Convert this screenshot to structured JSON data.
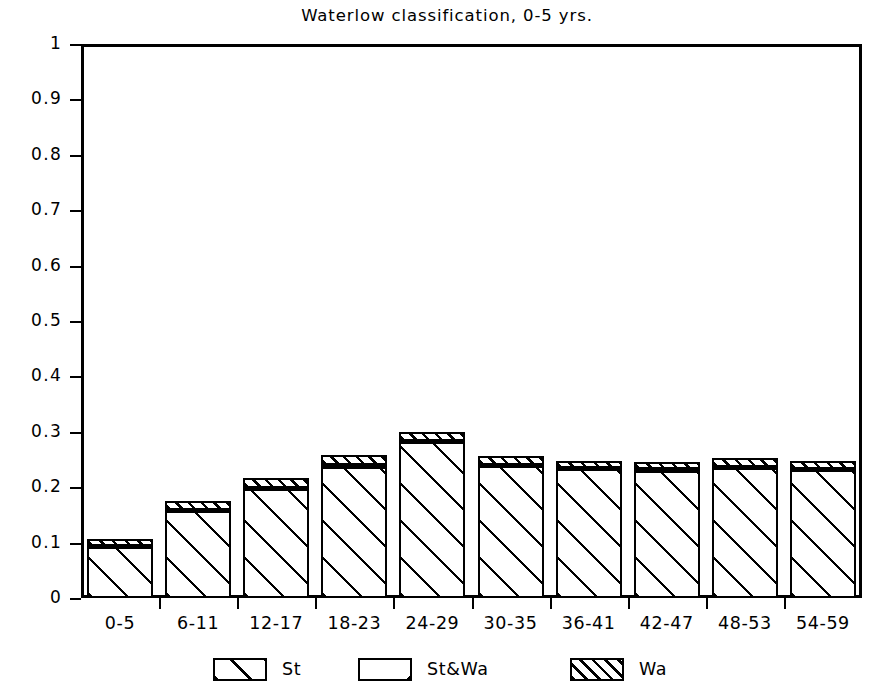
{
  "chart_data": {
    "type": "bar",
    "title": "Waterlow classification, 0-5 yrs.",
    "xlabel": "",
    "ylabel": "",
    "ylim": [
      0,
      1
    ],
    "yticks": [
      "0",
      "0.1",
      "0.2",
      "0.3",
      "0.4",
      "0.5",
      "0.6",
      "0.7",
      "0.8",
      "0.9",
      "1"
    ],
    "ytick_values": [
      0,
      0.1,
      0.2,
      0.3,
      0.4,
      0.5,
      0.6,
      0.7,
      0.8,
      0.9,
      1
    ],
    "grid": false,
    "stacked": true,
    "legend_position": "bottom",
    "categories": [
      "0-5",
      "6-11",
      "12-17",
      "18-23",
      "24-29",
      "30-35",
      "36-41",
      "42-47",
      "48-53",
      "54-59"
    ],
    "series": [
      {
        "name": "St",
        "values": [
          0.092,
          0.157,
          0.196,
          0.237,
          0.281,
          0.239,
          0.232,
          0.23,
          0.235,
          0.231
        ]
      },
      {
        "name": "St&Wa",
        "values": [
          0.002,
          0.002,
          0.002,
          0.003,
          0.002,
          0.002,
          0.002,
          0.002,
          0.002,
          0.002
        ]
      },
      {
        "name": "Wa",
        "values": [
          0.013,
          0.017,
          0.019,
          0.018,
          0.016,
          0.015,
          0.014,
          0.014,
          0.015,
          0.014
        ]
      }
    ],
    "totals": [
      0.107,
      0.176,
      0.217,
      0.258,
      0.299,
      0.256,
      0.248,
      0.246,
      0.252,
      0.247
    ],
    "legend": [
      {
        "label": "St",
        "pattern": "forward-diagonal-wide"
      },
      {
        "label": "St&Wa",
        "pattern": "backward-diagonal-single"
      },
      {
        "label": "Wa",
        "pattern": "forward-diagonal-dense"
      }
    ]
  }
}
